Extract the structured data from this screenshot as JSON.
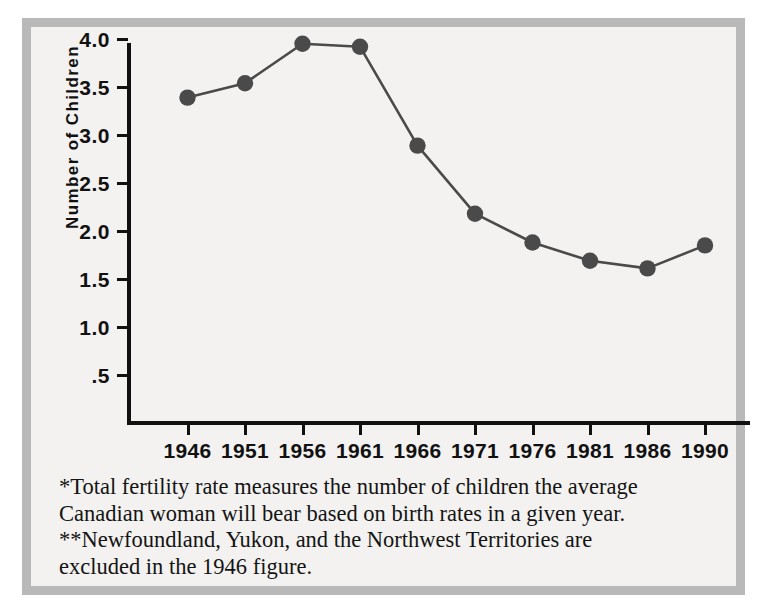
{
  "figure": {
    "y_axis_title": "Number of Children",
    "colors": {
      "frame": "#b9b9b9",
      "background": "#f3f2f0",
      "axis": "#111111",
      "series": "#4a4a4a",
      "text": "#141414"
    }
  },
  "chart_data": {
    "type": "line",
    "title": "",
    "xlabel": "",
    "ylabel": "Number of Children",
    "categories": [
      "1946",
      "1951",
      "1956",
      "1961",
      "1966",
      "1971",
      "1976",
      "1981",
      "1986",
      "1990"
    ],
    "values": [
      3.39,
      3.54,
      3.95,
      3.92,
      2.89,
      2.18,
      1.88,
      1.69,
      1.61,
      1.85
    ],
    "series": [
      {
        "name": "Total fertility rate",
        "values": [
          3.39,
          3.54,
          3.95,
          3.92,
          2.89,
          2.18,
          1.88,
          1.69,
          1.61,
          1.85
        ]
      }
    ],
    "ylim": [
      0,
      4.25
    ],
    "ytick_values": [
      4.0,
      3.5,
      3.0,
      2.5,
      2.0,
      1.5,
      1.0,
      0.5
    ],
    "ytick_labels": [
      "4.0",
      "3.5",
      "3.0",
      "2.5",
      "2.0",
      "1.5",
      "1.0",
      ".5"
    ],
    "xtick_labels": [
      "1946",
      "1951",
      "1956",
      "1961",
      "1966",
      "1971",
      "1976",
      "1981",
      "1986",
      "1990"
    ],
    "grid": false,
    "legend": false,
    "marker": "circle"
  },
  "footnotes": {
    "line1": "*Total fertility rate measures the number of children the average",
    "line2": "Canadian woman will bear based on birth rates in a given year.",
    "line3": "**Newfoundland, Yukon, and the Northwest Territories are",
    "line4": "excluded in the 1946 figure."
  }
}
